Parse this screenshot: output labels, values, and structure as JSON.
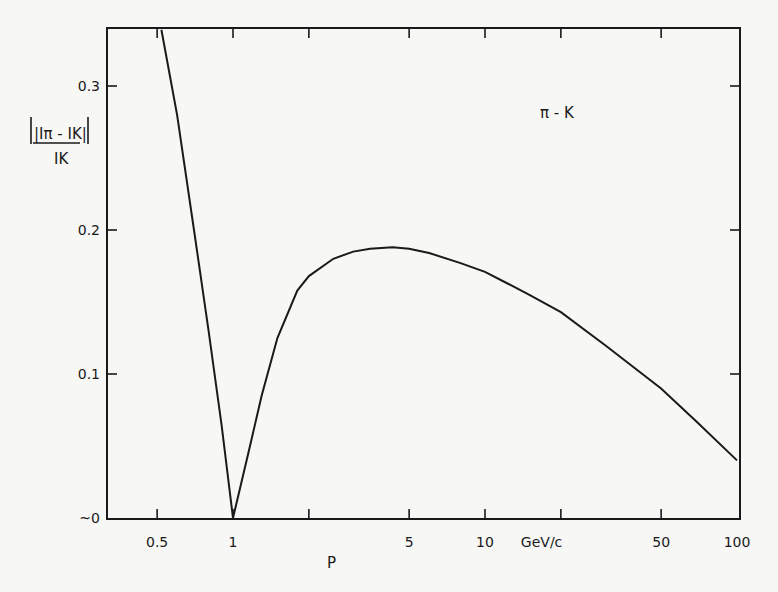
{
  "chart_data": {
    "type": "line",
    "title": "",
    "annotation": "π - K",
    "xlabel": "P",
    "xunit": "GeV/c",
    "ylabel_numerator": "|Iπ - IK|",
    "ylabel_denominator": "IK",
    "xscale": "log",
    "xlim": [
      0.4,
      100
    ],
    "ylim": [
      0,
      0.34
    ],
    "x_ticks": [
      {
        "value": 0.5,
        "label": "0.5"
      },
      {
        "value": 1,
        "label": "1"
      },
      {
        "value": 2,
        "label": ""
      },
      {
        "value": 5,
        "label": "5"
      },
      {
        "value": 10,
        "label": "10"
      },
      {
        "value": 20,
        "label": "GeV/c"
      },
      {
        "value": 50,
        "label": "50"
      },
      {
        "value": 100,
        "label": "100"
      }
    ],
    "y_ticks": [
      {
        "value": 0,
        "label": "~0"
      },
      {
        "value": 0.1,
        "label": "0.1"
      },
      {
        "value": 0.2,
        "label": "0.2"
      },
      {
        "value": 0.3,
        "label": "0.3"
      }
    ],
    "grid": false,
    "series": [
      {
        "name": "π - K",
        "x": [
          0.52,
          0.6,
          0.7,
          0.8,
          0.9,
          1.0,
          1.15,
          1.3,
          1.5,
          1.8,
          2.0,
          2.5,
          3.0,
          3.5,
          4.3,
          5.0,
          6.0,
          8.0,
          10,
          15,
          20,
          30,
          50,
          70,
          100
        ],
        "values": [
          0.339,
          0.28,
          0.2,
          0.13,
          0.065,
          0.0,
          0.045,
          0.085,
          0.125,
          0.158,
          0.168,
          0.18,
          0.185,
          0.187,
          0.188,
          0.187,
          0.184,
          0.177,
          0.171,
          0.155,
          0.143,
          0.12,
          0.09,
          0.066,
          0.04
        ]
      }
    ]
  }
}
